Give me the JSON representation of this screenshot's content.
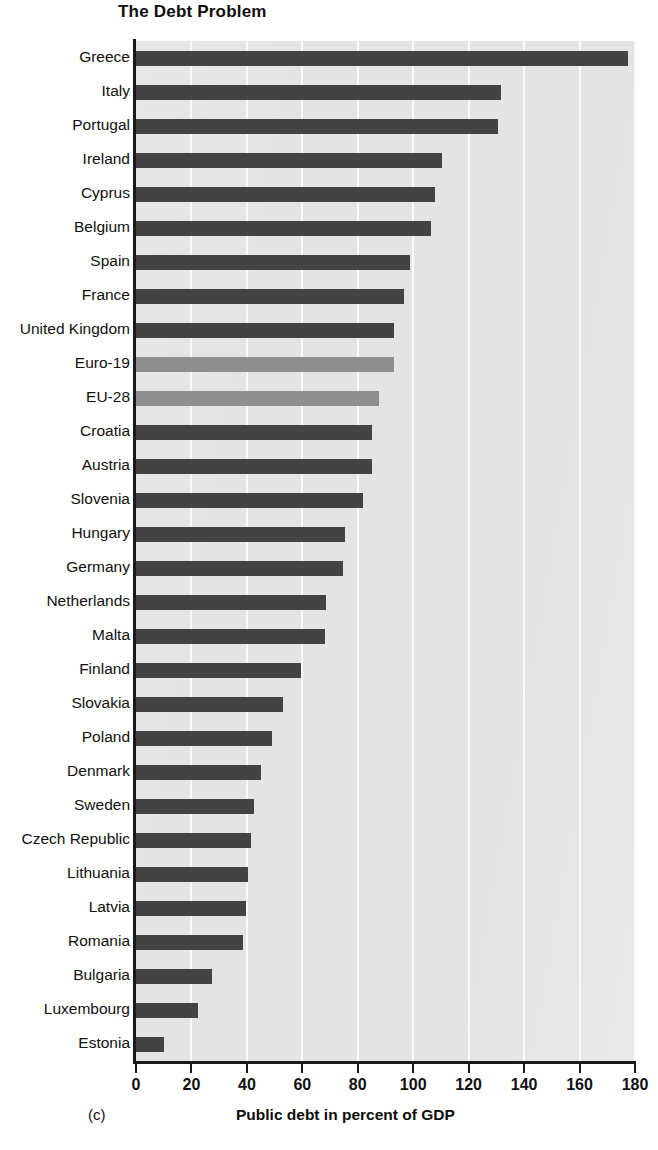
{
  "chart_data": {
    "type": "bar",
    "orientation": "horizontal",
    "title": "The Debt Problem",
    "xlabel": "Public debt in percent of GDP",
    "ylabel": "",
    "xlim": [
      0,
      180
    ],
    "xticks": [
      0,
      20,
      40,
      60,
      80,
      100,
      120,
      140,
      160,
      180
    ],
    "xtick_labels": [
      "0",
      "20",
      "40",
      "60",
      "80",
      "100",
      "120",
      "140",
      "160",
      "180"
    ],
    "grid": "vertical-white-gridlines",
    "legend": "none",
    "panel_letter": "(c)",
    "categories": [
      "Greece",
      "Italy",
      "Portugal",
      "Ireland",
      "Cyprus",
      "Belgium",
      "Spain",
      "France",
      "United Kingdom",
      "Euro-19",
      "EU-28",
      "Croatia",
      "Austria",
      "Slovenia",
      "Hungary",
      "Germany",
      "Netherlands",
      "Malta",
      "Finland",
      "Slovakia",
      "Poland",
      "Denmark",
      "Sweden",
      "Czech Republic",
      "Lithuania",
      "Latvia",
      "Romania",
      "Bulgaria",
      "Luxembourg",
      "Estonia"
    ],
    "values": [
      177.5,
      131.5,
      130.5,
      110.5,
      108.0,
      106.5,
      99.0,
      96.5,
      93.0,
      93.0,
      87.5,
      85.0,
      85.0,
      82.0,
      75.5,
      74.5,
      68.5,
      68.0,
      59.5,
      53.0,
      49.0,
      45.0,
      42.5,
      41.5,
      40.5,
      39.5,
      38.5,
      27.5,
      22.5,
      10.0
    ],
    "series_note": "Aggregates highlighted in lighter gray",
    "aggregate_categories": [
      "Euro-19",
      "EU-28"
    ],
    "colors": {
      "bar": "#434343",
      "aggregate_bar": "#8e8e8e",
      "plot_background": "#e4e4e4",
      "gridline": "#fafafa",
      "axis": "#1a1a1a",
      "text": "#101010"
    }
  }
}
